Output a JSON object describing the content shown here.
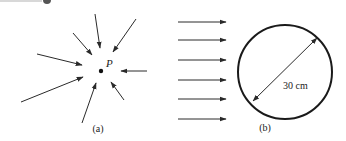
{
  "panels": {
    "a": {
      "caption": "(a)",
      "point_label": "P",
      "point": {
        "x": 101,
        "y": 71
      },
      "arrows": [
        {
          "x1": 95,
          "y1": 14,
          "x2": 100,
          "y2": 48
        },
        {
          "x1": 136,
          "y1": 19,
          "x2": 113,
          "y2": 52
        },
        {
          "x1": 73,
          "y1": 33,
          "x2": 92,
          "y2": 55
        },
        {
          "x1": 37,
          "y1": 54,
          "x2": 82,
          "y2": 65
        },
        {
          "x1": 21,
          "y1": 102,
          "x2": 83,
          "y2": 77
        },
        {
          "x1": 82,
          "y1": 123,
          "x2": 96,
          "y2": 83
        },
        {
          "x1": 124,
          "y1": 100,
          "x2": 111,
          "y2": 82
        },
        {
          "x1": 147,
          "y1": 71,
          "x2": 121,
          "y2": 71
        }
      ]
    },
    "b": {
      "caption": "(b)",
      "diameter_label": "30 cm",
      "circle": {
        "cx": 285,
        "cy": 72,
        "r": 47
      },
      "diameter": {
        "x1": 253,
        "y1": 101,
        "x2": 317,
        "y2": 38
      },
      "arrows": [
        {
          "x1": 178,
          "y1": 22,
          "x2": 226,
          "y2": 22
        },
        {
          "x1": 178,
          "y1": 40,
          "x2": 226,
          "y2": 40
        },
        {
          "x1": 178,
          "y1": 60,
          "x2": 226,
          "y2": 60
        },
        {
          "x1": 178,
          "y1": 80,
          "x2": 226,
          "y2": 80
        },
        {
          "x1": 178,
          "y1": 99,
          "x2": 226,
          "y2": 99
        },
        {
          "x1": 178,
          "y1": 119,
          "x2": 226,
          "y2": 119
        }
      ]
    }
  },
  "colors": {
    "stroke": "#2a2a2a",
    "background": "#ffffff",
    "top_bar": "#d8d8d8",
    "top_dot": "#555555"
  }
}
